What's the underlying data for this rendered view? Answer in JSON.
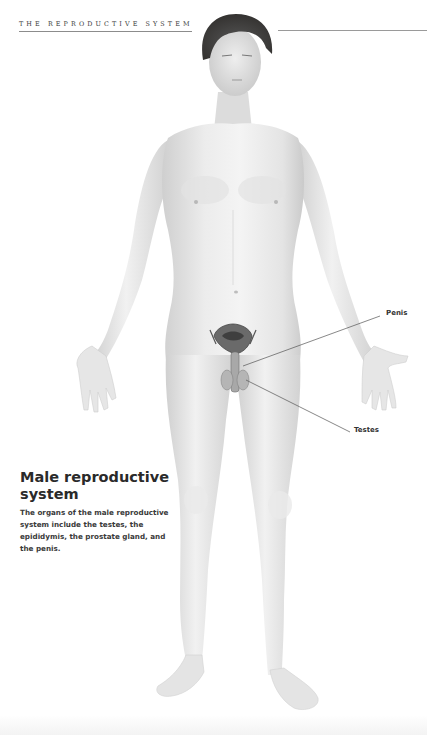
{
  "header": {
    "running_head": "THE REPRODUCTIVE SYSTEM"
  },
  "figure": {
    "callouts": [
      {
        "label": "Penis",
        "x": 386,
        "y": 313
      },
      {
        "label": "Testes",
        "x": 354,
        "y": 430
      }
    ],
    "colors": {
      "skin_light": "#f2f2f2",
      "skin_mid": "#dcdcdc",
      "skin_shadow": "#c4c4c4",
      "hair": "#3d3a38",
      "organ_dark": "#4a4a4a",
      "leader_line": "#555555"
    }
  },
  "caption": {
    "title": "Male reproductive system",
    "body": "The organs of the male reproductive system include the testes, the epididymis, the prostate gland, and the penis."
  }
}
